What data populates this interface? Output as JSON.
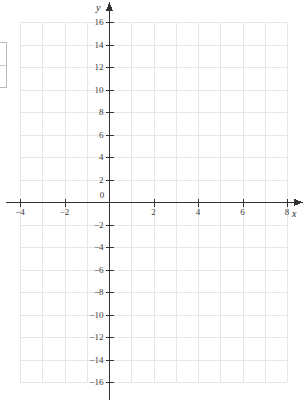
{
  "figure": {
    "kind": "cartesian-coordinate-grid",
    "background_color": "#ffffff",
    "grid_color": "#e6e6e6",
    "axis_color": "#333333",
    "label_color": "#3a3a3a",
    "width_px": 306,
    "height_px": 405
  },
  "chart_data": {
    "type": "scatter",
    "title": "",
    "subtitle": "",
    "xlabel": "x",
    "ylabel": "y",
    "xlim": [
      -4,
      8
    ],
    "ylim": [
      -16,
      16
    ],
    "x_major_step": 2,
    "y_major_step": 2,
    "x_minor_step": 1,
    "y_minor_step": 2,
    "x_tick_labels": [
      "−4",
      "−2",
      "0",
      "2",
      "4",
      "6",
      "8"
    ],
    "x_tick_values": [
      -4,
      -2,
      0,
      2,
      4,
      6,
      8
    ],
    "y_tick_labels": [
      "16",
      "14",
      "12",
      "10",
      "8",
      "6",
      "4",
      "2",
      "−2",
      "−4",
      "−6",
      "−8",
      "−10",
      "−12",
      "−14",
      "−16"
    ],
    "y_tick_values": [
      16,
      14,
      12,
      10,
      8,
      6,
      4,
      2,
      -2,
      -4,
      -6,
      -8,
      -10,
      -12,
      -14,
      -16
    ],
    "grid": true,
    "legend": false,
    "legend_position": "none",
    "series": [],
    "annotations": [],
    "origin_label": "0",
    "x_axis_arrow": true,
    "y_axis_arrow": true
  },
  "axis_names": {
    "x": "x",
    "y": "y"
  },
  "edge_widget": {
    "present": true,
    "label": ""
  }
}
